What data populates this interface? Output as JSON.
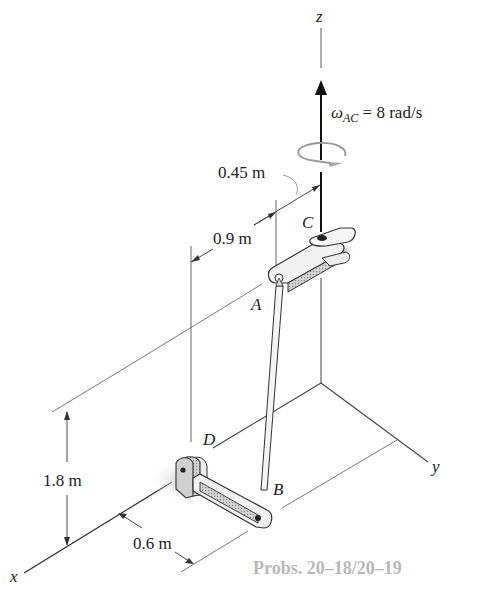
{
  "figure": {
    "caption": "Probs. 20–18/20–19",
    "axes": {
      "x": "x",
      "y": "y",
      "z": "z"
    },
    "points": {
      "A": "A",
      "B": "B",
      "C": "C",
      "D": "D"
    },
    "angular_velocity": {
      "symbol": "ω",
      "subscript": "AC",
      "value_text": " = 8 rad/s"
    },
    "dimensions": {
      "d1": "0.45 m",
      "d2": "0.9 m",
      "d3": "1.8 m",
      "d4": "0.6 m"
    },
    "colors": {
      "line": "#333333",
      "link_fill": "#c8c8c8",
      "link_shade": "#9a9a9a",
      "rotation_arrow": "#aaaaaa",
      "caption": "#b8b8b8"
    }
  }
}
